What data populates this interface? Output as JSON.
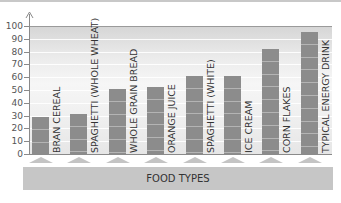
{
  "chart_data": {
    "type": "bar",
    "title": "",
    "xlabel": "FOOD TYPES",
    "ylabel": "",
    "ylim": [
      0,
      100
    ],
    "yticks": [
      0,
      10,
      20,
      30,
      40,
      50,
      60,
      70,
      80,
      90,
      100
    ],
    "grid": true,
    "legend": null,
    "categories": [
      "BRAN CEREAL",
      "SPAGHETTI (WHOLE WHEAT)",
      "WHOLE GRAIN BREAD",
      "ORANGE JUICE",
      "SPAGHETTI (WHITE)",
      "ICE CREAM",
      "CORN FLAKES",
      "TYPICAL ENERGY DRINK"
    ],
    "values": [
      29,
      31,
      51,
      52,
      61,
      61,
      82,
      95
    ],
    "colors": {
      "bar": "#8c8c8c",
      "axis": "#8a8a8a",
      "xlabel_box": "#c6c6c6"
    }
  },
  "axis": {
    "tick_labels": [
      "0",
      "10",
      "20",
      "30",
      "40",
      "50",
      "60",
      "70",
      "80",
      "90",
      "100"
    ],
    "x_title": "FOOD TYPES"
  },
  "bars": [
    {
      "label": "BRAN CEREAL",
      "value": 29
    },
    {
      "label": "SPAGHETTI (WHOLE WHEAT)",
      "value": 31
    },
    {
      "label": "WHOLE GRAIN BREAD",
      "value": 51
    },
    {
      "label": "ORANGE JUICE",
      "value": 52
    },
    {
      "label": "SPAGHETTI (WHITE)",
      "value": 61
    },
    {
      "label": "ICE CREAM",
      "value": 61
    },
    {
      "label": "CORN FLAKES",
      "value": 82
    },
    {
      "label": "TYPICAL ENERGY DRINK",
      "value": 95
    }
  ]
}
